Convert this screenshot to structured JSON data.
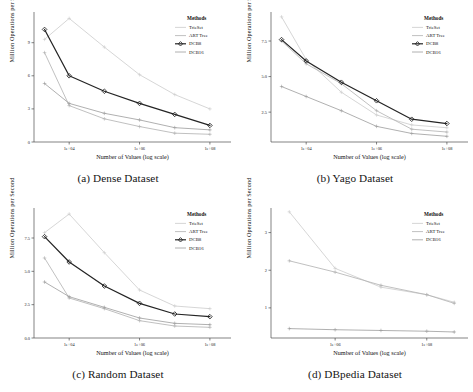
{
  "figure": {
    "panels": [
      {
        "id": "a",
        "caption": "(a) Dense Dataset",
        "chart_data": {
          "type": "line",
          "title": "",
          "xlabel": "Number of Values (log scale)",
          "ylabel": "Million Operations per Second",
          "xticklabels": [
            "1e+04",
            "1e+06",
            "1e+08"
          ],
          "xtickvalues": [
            4,
            6,
            8
          ],
          "yticklabels": [
            "0",
            "3",
            "6",
            "9"
          ],
          "ytickvalues": [
            0,
            3,
            6,
            9
          ],
          "xlim": [
            3.0,
            8.6
          ],
          "ylim": [
            0,
            11.6
          ],
          "grid": false,
          "legend_title": "Methods",
          "legend_position": "top-right",
          "series": [
            {
              "name": "TrieSet",
              "x": [
                3.3,
                4.0,
                5.0,
                6.0,
                7.0,
                8.0
              ],
              "values": [
                9.3,
                11.2,
                8.6,
                6.1,
                4.3,
                3.0
              ]
            },
            {
              "name": "ART Tree",
              "x": [
                3.3,
                4.0,
                5.0,
                6.0,
                7.0,
                8.0
              ],
              "values": [
                8.1,
                3.3,
                2.1,
                1.4,
                0.8,
                0.7
              ]
            },
            {
              "name": "DCB8",
              "x": [
                3.3,
                4.0,
                5.0,
                6.0,
                7.0,
                8.0
              ],
              "values": [
                10.2,
                6.0,
                4.6,
                3.5,
                2.5,
                1.5
              ]
            },
            {
              "name": "DCB16",
              "x": [
                3.3,
                4.0,
                5.0,
                6.0,
                7.0,
                8.0
              ],
              "values": [
                5.3,
                3.5,
                2.6,
                2.0,
                1.3,
                1.1
              ]
            }
          ]
        }
      },
      {
        "id": "b",
        "caption": "(b) Yago Dataset",
        "chart_data": {
          "type": "line",
          "title": "",
          "xlabel": "Number of Values (log scale)",
          "ylabel": "Million Operations per Second",
          "xticklabels": [
            "1e+04",
            "1e+06",
            "1e+08"
          ],
          "xtickvalues": [
            4,
            6,
            8
          ],
          "yticklabels": [
            "2.5",
            "5.0",
            "7.5"
          ],
          "ytickvalues": [
            2.5,
            5.0,
            7.5
          ],
          "xlim": [
            3.0,
            8.6
          ],
          "ylim": [
            0.4,
            9.4
          ],
          "grid": false,
          "legend_title": "Methods",
          "legend_position": "top-right",
          "series": [
            {
              "name": "TrieSet",
              "x": [
                3.3,
                4.0,
                5.0,
                6.0,
                7.0,
                8.0
              ],
              "values": [
                9.2,
                6.2,
                3.9,
                2.3,
                1.6,
                1.4
              ]
            },
            {
              "name": "ART Tree",
              "x": [
                3.3,
                4.0,
                5.0,
                6.0,
                7.0,
                8.0
              ],
              "values": [
                7.5,
                5.9,
                4.5,
                2.6,
                1.3,
                1.1
              ]
            },
            {
              "name": "DCB8",
              "x": [
                3.3,
                4.0,
                5.0,
                6.0,
                7.0,
                8.0
              ],
              "values": [
                7.6,
                6.1,
                4.6,
                3.3,
                2.0,
                1.7
              ]
            },
            {
              "name": "DCB16",
              "x": [
                3.3,
                4.0,
                5.0,
                6.0,
                7.0,
                8.0
              ],
              "values": [
                4.3,
                3.6,
                2.6,
                1.5,
                1.0,
                0.8
              ]
            }
          ]
        }
      },
      {
        "id": "c",
        "caption": "(c) Random Dataset",
        "chart_data": {
          "type": "line",
          "title": "",
          "xlabel": "Number of Values (log scale)",
          "ylabel": "Million Operations per Second",
          "xticklabels": [
            "1e+04",
            "1e+06",
            "1e+08"
          ],
          "xtickvalues": [
            4,
            6,
            8
          ],
          "yticklabels": [
            "0.0",
            "2.5",
            "5.0",
            "7.5"
          ],
          "ytickvalues": [
            0.0,
            2.5,
            5.0,
            7.5
          ],
          "xlim": [
            3.0,
            8.6
          ],
          "ylim": [
            0,
            9.6
          ],
          "grid": false,
          "legend_title": "Methods",
          "legend_position": "top-right",
          "series": [
            {
              "name": "TrieSet",
              "x": [
                3.3,
                4.0,
                5.0,
                6.0,
                7.0,
                8.0
              ],
              "values": [
                7.9,
                9.3,
                6.4,
                3.6,
                2.4,
                2.2
              ]
            },
            {
              "name": "ART Tree",
              "x": [
                3.3,
                4.0,
                5.0,
                6.0,
                7.0,
                8.0
              ],
              "values": [
                6.0,
                3.0,
                2.2,
                1.3,
                0.9,
                0.8
              ]
            },
            {
              "name": "DCB8",
              "x": [
                3.3,
                4.0,
                5.0,
                6.0,
                7.0,
                8.0
              ],
              "values": [
                7.6,
                5.7,
                3.9,
                2.6,
                1.8,
                1.6
              ]
            },
            {
              "name": "DCB16",
              "x": [
                3.3,
                4.0,
                5.0,
                6.0,
                7.0,
                8.0
              ],
              "values": [
                4.2,
                3.1,
                2.3,
                1.5,
                1.1,
                1.0
              ]
            }
          ]
        }
      },
      {
        "id": "d",
        "caption": "(d) DBpedia Dataset",
        "chart_data": {
          "type": "line",
          "title": "",
          "xlabel": "Number of Values (log scale)",
          "ylabel": "Million Operations per Second",
          "xticklabels": [
            "1e+06",
            "1e+08"
          ],
          "xtickvalues": [
            6,
            8
          ],
          "yticklabels": [
            "1",
            "2",
            "3"
          ],
          "ytickvalues": [
            1,
            2,
            3
          ],
          "xlim": [
            4.6,
            8.9
          ],
          "ylim": [
            0.2,
            3.6
          ],
          "grid": false,
          "legend_title": "Methods",
          "legend_position": "top-right",
          "series": [
            {
              "name": "TrieSet",
              "x": [
                5.0,
                6.0,
                7.0,
                8.0,
                8.6
              ],
              "values": [
                3.55,
                2.05,
                1.55,
                1.35,
                1.15
              ]
            },
            {
              "name": "ART Tree",
              "x": [
                5.0,
                6.0,
                7.0,
                8.0,
                8.6
              ],
              "values": [
                2.25,
                1.95,
                1.6,
                1.35,
                1.12
              ]
            },
            {
              "name": "DCB16",
              "x": [
                5.0,
                6.0,
                7.0,
                8.0,
                8.6
              ],
              "values": [
                0.45,
                0.42,
                0.4,
                0.38,
                0.36
              ]
            }
          ]
        }
      }
    ],
    "legend": {
      "title": "Methods",
      "entries": [
        {
          "name": "TrieSet",
          "color": "#c9c9c9",
          "marker": "none"
        },
        {
          "name": "ART Tree",
          "color": "#b4b4b4",
          "marker": "none"
        },
        {
          "name": "DCB8",
          "color": "#2b2b2b",
          "marker": "diamond"
        },
        {
          "name": "DCB16",
          "color": "#9a9a9a",
          "marker": "none"
        }
      ]
    },
    "colors": {
      "TrieSet": "#cccccc",
      "ART Tree": "#b0b0b0",
      "DCB8": "#242424",
      "DCB16": "#9c9c9c",
      "axis": "#4d4d4d",
      "text": "#141414"
    }
  }
}
